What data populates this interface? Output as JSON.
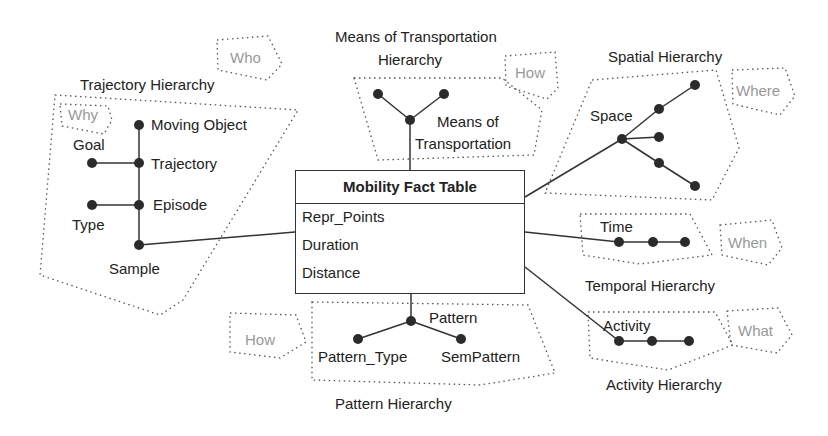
{
  "fact_table": {
    "title": "Mobility Fact Table",
    "measures": [
      "Repr_Points",
      "Duration",
      "Distance"
    ]
  },
  "hierarchies": {
    "trajectory": {
      "title": "Trajectory Hierarchy",
      "question": "Why",
      "levels": [
        "Moving Object",
        "Goal",
        "Trajectory",
        "Episode",
        "Type",
        "Sample"
      ]
    },
    "transport": {
      "title_line1": "Means of Transportation",
      "title_line2": "Hierarchy",
      "question": "How",
      "level_line1": "Means of",
      "level_line2": "Transportation"
    },
    "spatial": {
      "title": "Spatial Hierarchy",
      "question": "Where",
      "level": "Space"
    },
    "temporal": {
      "title": "Temporal Hierarchy",
      "question": "When",
      "level": "Time"
    },
    "activity": {
      "title": "Activity Hierarchy",
      "question": "What",
      "level": "Activity"
    },
    "pattern": {
      "title": "Pattern Hierarchy",
      "question": "How",
      "levels": [
        "Pattern",
        "Pattern_Type",
        "SemPattern"
      ]
    }
  },
  "who_label": "Who",
  "colors": {
    "node": "#2b2b2b",
    "line": "#333333",
    "dotted": "#555555",
    "question": "#999999"
  }
}
